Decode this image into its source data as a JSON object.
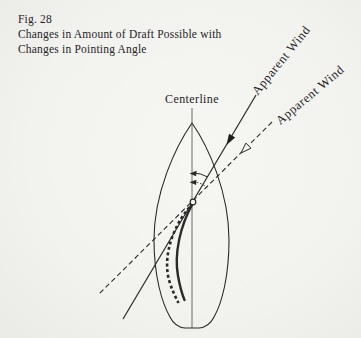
{
  "figure_caption": {
    "fig_label": "Fig. 28",
    "title_line_1": "Changes in Amount of Draft Possible with",
    "title_line_2": "Changes in Pointing Angle"
  },
  "labels": {
    "centerline": "Centerline",
    "apparent_wind_high": "Apparent Wind",
    "apparent_wind_low": "Apparent Wind"
  },
  "diagram_semantics": {
    "hull": "sailboat hull seen from above",
    "solid_wind_line": "apparent wind at higher pointing angle (filled arrowhead)",
    "dashed_wind_line": "apparent wind at lower pointing angle (open arrowhead)",
    "solid_sail_curve": "flatter sail (less draft)",
    "dotted_sail_curve": "fuller sail (more draft)",
    "arcs": "pointing-angle arcs between centerline and wind directions"
  },
  "colors": {
    "paper": "#f2f2ef",
    "ink": "#2a2a28",
    "text": "#26241f"
  }
}
